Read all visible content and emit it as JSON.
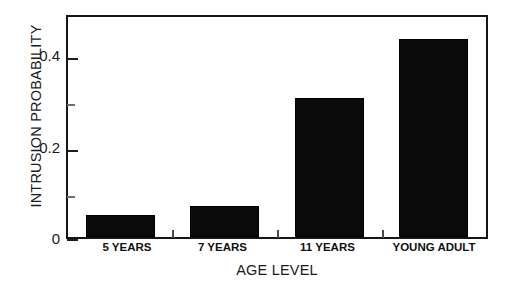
{
  "chart_data": {
    "type": "bar",
    "title": "",
    "xlabel": "AGE LEVEL",
    "ylabel": "INTRUSION PROBABILITY",
    "categories": [
      "5 YEARS",
      "7 YEARS",
      "11 YEARS",
      "YOUNG ADULT"
    ],
    "values": [
      0.05,
      0.07,
      0.31,
      0.44
    ],
    "ylim": [
      0,
      0.49
    ],
    "ytick_major": [
      0,
      0.2,
      0.4
    ],
    "ytick_major_labels": [
      "0",
      "0.2",
      "0.4"
    ],
    "ytick_minor": [
      0.1,
      0.3
    ],
    "grid": false,
    "legend": false,
    "bar_color": "#0b0b0b",
    "axis_color": "#151515",
    "background": "#ffffff"
  },
  "axes": {
    "y_title": "INTRUSION PROBABILITY",
    "x_title": "AGE LEVEL",
    "y_labels": [
      {
        "text": "0.4",
        "value": 0.4
      },
      {
        "text": "0.2",
        "value": 0.2
      },
      {
        "text": "0",
        "value": 0
      }
    ],
    "x_labels": [
      {
        "text": "5 YEARS"
      },
      {
        "text": "7 YEARS"
      },
      {
        "text": "11 YEARS"
      },
      {
        "text": "YOUNG ADULT"
      }
    ]
  },
  "bars": [
    {
      "category": "5 YEARS",
      "value": 0.05
    },
    {
      "category": "7 YEARS",
      "value": 0.07
    },
    {
      "category": "11 YEARS",
      "value": 0.31
    },
    {
      "category": "YOUNG ADULT",
      "value": 0.44
    }
  ]
}
